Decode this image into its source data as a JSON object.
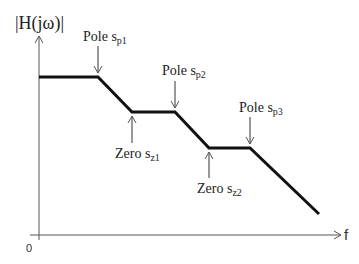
{
  "diagram": {
    "y_axis_label": "|H(jω)|",
    "x_axis_label": "f",
    "origin_label": "0",
    "colors": {
      "curve": "#111111",
      "axis": "#555555",
      "text": "#222222"
    },
    "annotations": [
      {
        "id": "pole-sp1",
        "prefix": "Pole s",
        "sub": "p1",
        "position": "above"
      },
      {
        "id": "zero-sz1",
        "prefix": "Zero s",
        "sub": "z1",
        "position": "below"
      },
      {
        "id": "pole-sp2",
        "prefix": "Pole s",
        "sub": "p2",
        "position": "above"
      },
      {
        "id": "zero-sz2",
        "prefix": "Zero s",
        "sub": "z2",
        "position": "below"
      },
      {
        "id": "pole-sp3",
        "prefix": "Pole s",
        "sub": "p3",
        "position": "above"
      }
    ],
    "curve_points": [
      [
        39,
        77
      ],
      [
        98,
        77
      ],
      [
        132,
        112
      ],
      [
        175,
        112
      ],
      [
        209,
        148
      ],
      [
        250,
        148
      ],
      [
        319,
        214
      ]
    ]
  }
}
